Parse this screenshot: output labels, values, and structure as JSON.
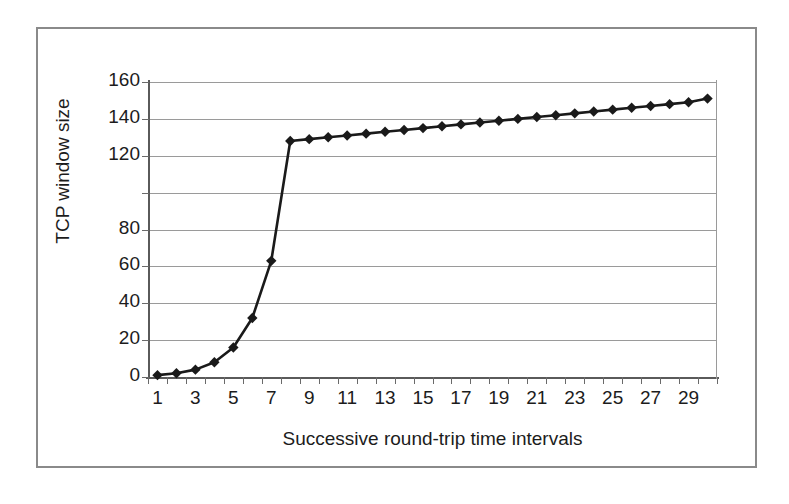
{
  "figure": {
    "border_color": "#8a8a8a",
    "background": "#ffffff"
  },
  "chart_data": {
    "type": "line",
    "title": "",
    "subtitle": "",
    "xlabel": "Successive round-trip time intervals",
    "ylabel": "TCP window size",
    "grid": true,
    "legend": false,
    "legend_position": "none",
    "series_color": "#1a1a1a",
    "marker": "diamond",
    "gridline_color": "#9a9a9a",
    "axis_color": "#5a5a5a",
    "xlim": [
      0.5,
      30.5
    ],
    "ylim": [
      0,
      160
    ],
    "x_tick_labels": [
      "1",
      "3",
      "5",
      "7",
      "9",
      "11",
      "13",
      "15",
      "17",
      "19",
      "21",
      "23",
      "25",
      "27",
      "29"
    ],
    "x_tick_values": [
      1,
      3,
      5,
      7,
      9,
      11,
      13,
      15,
      17,
      19,
      21,
      23,
      25,
      27,
      29
    ],
    "y_tick_labels": [
      "0",
      "20",
      "40",
      "60",
      "80",
      "",
      "120",
      "140",
      "160"
    ],
    "y_tick_values": [
      0,
      20,
      40,
      60,
      80,
      100,
      120,
      140,
      160
    ],
    "x": [
      1,
      2,
      3,
      4,
      5,
      6,
      7,
      8,
      9,
      10,
      11,
      12,
      13,
      14,
      15,
      16,
      17,
      18,
      19,
      20,
      21,
      22,
      23,
      24,
      25,
      26,
      27,
      28,
      29,
      30
    ],
    "values": [
      1,
      2,
      4,
      8,
      16,
      32,
      63,
      128,
      129,
      130,
      131,
      132,
      133,
      134,
      135,
      136,
      137,
      138,
      139,
      140,
      141,
      142,
      143,
      144,
      145,
      146,
      147,
      148,
      149,
      151
    ],
    "annotations": []
  }
}
